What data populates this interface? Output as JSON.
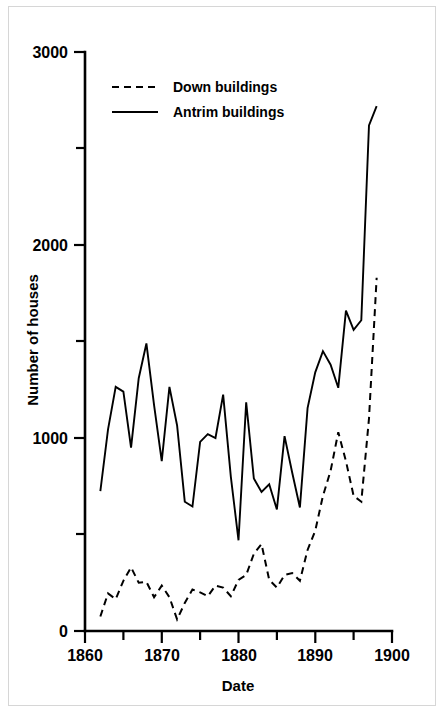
{
  "chart_data": {
    "type": "line",
    "title": "",
    "xlabel": "Date",
    "ylabel": "Number of houses",
    "xlim": [
      1860,
      1900
    ],
    "ylim": [
      0,
      3000
    ],
    "grid": false,
    "legend_position": "top-left",
    "x_ticks_major": [
      1860,
      1870,
      1880,
      1890,
      1900
    ],
    "x_ticks_minor": [
      1865,
      1875,
      1885,
      1895
    ],
    "x_tick_labels": [
      "1860",
      "1870",
      "1880",
      "1890",
      "1900"
    ],
    "y_ticks_major": [
      0,
      1000,
      2000,
      3000
    ],
    "y_ticks_minor": [
      500,
      1500,
      2500
    ],
    "y_tick_labels": [
      "0",
      "1000",
      "2000",
      "3000"
    ],
    "series": [
      {
        "name": "Down buildings",
        "style": "dashed",
        "x": [
          1862,
          1863,
          1864,
          1865,
          1866,
          1867,
          1868,
          1869,
          1870,
          1871,
          1872,
          1873,
          1874,
          1875,
          1876,
          1877,
          1878,
          1879,
          1880,
          1881,
          1882,
          1883,
          1884,
          1885,
          1886,
          1887,
          1888,
          1889,
          1890,
          1891,
          1892,
          1893,
          1894,
          1895,
          1896,
          1897,
          1898
        ],
        "values": [
          75,
          195,
          165,
          260,
          330,
          250,
          255,
          175,
          235,
          175,
          60,
          145,
          215,
          200,
          180,
          235,
          225,
          180,
          265,
          290,
          400,
          450,
          265,
          225,
          290,
          300,
          260,
          420,
          520,
          700,
          830,
          1030,
          880,
          700,
          670,
          1100,
          1830
        ]
      },
      {
        "name": "Antrim buildings",
        "style": "solid",
        "x": [
          1862,
          1863,
          1864,
          1865,
          1866,
          1867,
          1868,
          1869,
          1870,
          1871,
          1872,
          1873,
          1874,
          1875,
          1876,
          1877,
          1878,
          1879,
          1880,
          1881,
          1882,
          1883,
          1884,
          1885,
          1886,
          1887,
          1888,
          1889,
          1890,
          1891,
          1892,
          1893,
          1894,
          1895,
          1896,
          1897,
          1898
        ],
        "values": [
          725,
          1045,
          1265,
          1240,
          950,
          1310,
          1490,
          1170,
          880,
          1265,
          1065,
          670,
          645,
          980,
          1020,
          1000,
          1225,
          800,
          470,
          1185,
          790,
          720,
          760,
          630,
          1010,
          820,
          640,
          1155,
          1340,
          1450,
          1380,
          1260,
          1660,
          1560,
          1610,
          2620,
          2720
        ]
      }
    ],
    "legend_entries": [
      {
        "label": "Down buildings",
        "style": "dashed"
      },
      {
        "label": "Antrim buildings",
        "style": "solid"
      }
    ]
  },
  "colors": {
    "background": "#ffffff",
    "ink": "#000000",
    "frame": "#d6d6d6"
  }
}
